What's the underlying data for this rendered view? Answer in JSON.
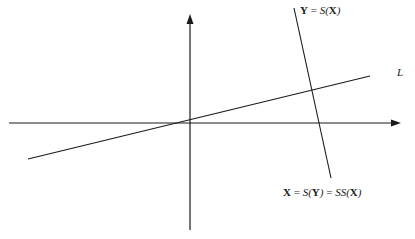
{
  "diagram": {
    "axes": {
      "origin": [
        190,
        123
      ],
      "x_axis": {
        "from": [
          9,
          123
        ],
        "to": [
          400,
          123
        ],
        "arrow": true
      },
      "y_axis": {
        "from": [
          190,
          230
        ],
        "to": [
          190,
          16
        ],
        "arrow": true
      }
    },
    "lines": [
      {
        "name": "L",
        "from": [
          28,
          159
        ],
        "to": [
          370,
          76
        ],
        "label": "L"
      },
      {
        "name": "S(X)",
        "from": [
          294,
          8
        ],
        "to": [
          331,
          178
        ]
      }
    ],
    "labels": {
      "top": {
        "bold1": "Y",
        "eq": " = ",
        "fn": "S(",
        "bold2": "X",
        "close": ")"
      },
      "line_L": "L",
      "bottom": {
        "bold1": "X",
        "eq1": " = ",
        "fn1": "S(",
        "bold2": "Y",
        "close1": ")",
        "eq2": " = ",
        "fn2": "SS(",
        "bold3": "X",
        "close2": ")"
      }
    },
    "colors": {
      "stroke": "#1a1a1a",
      "background": "#ffffff"
    }
  }
}
